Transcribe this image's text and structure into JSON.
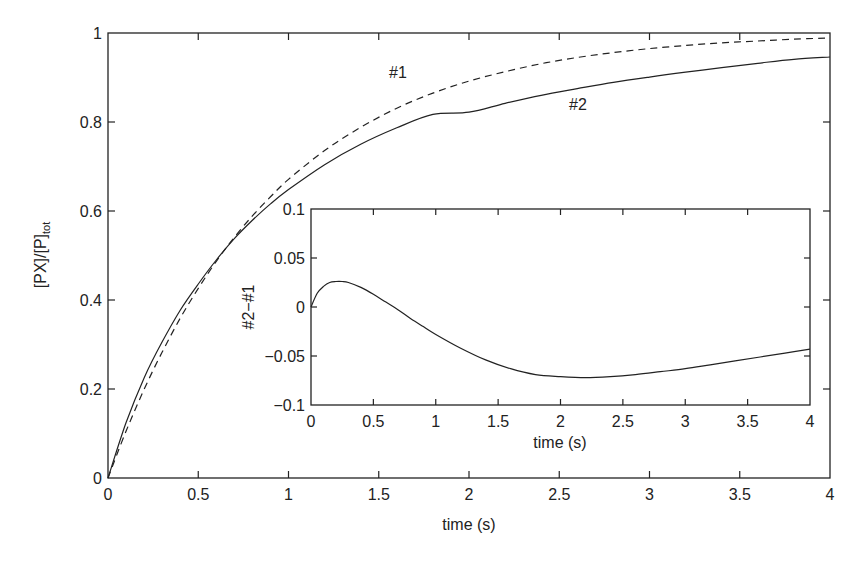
{
  "chart_data": [
    {
      "type": "line",
      "title": "",
      "xlabel": "time (s)",
      "ylabel": "[PX]/[P]tot",
      "ylabel_main": "[PX]/[P]",
      "ylabel_sub": "tot",
      "xlim": [
        0,
        4
      ],
      "ylim": [
        0,
        1
      ],
      "xticks": [
        0,
        0.5,
        1,
        1.5,
        2,
        2.5,
        3,
        3.5,
        4
      ],
      "xtick_labels": [
        "0",
        "0.5",
        "1",
        "1.5",
        "2",
        "2.5",
        "3",
        "3.5",
        "4"
      ],
      "yticks": [
        0,
        0.2,
        0.4,
        0.6,
        0.8,
        1
      ],
      "ytick_labels": [
        "0",
        "0.2",
        "0.4",
        "0.6",
        "0.8",
        "1"
      ],
      "grid": false,
      "x": [
        0,
        0.1,
        0.2,
        0.3,
        0.4,
        0.5,
        0.6,
        0.7,
        0.8,
        0.9,
        1.0,
        1.2,
        1.4,
        1.6,
        1.8,
        2.0,
        2.2,
        2.4,
        2.6,
        2.8,
        3.0,
        3.2,
        3.4,
        3.6,
        3.8,
        4.0
      ],
      "series": [
        {
          "name": "#1",
          "style": "dashed",
          "values": [
            0,
            0.105,
            0.199,
            0.283,
            0.359,
            0.426,
            0.487,
            0.541,
            0.589,
            0.632,
            0.671,
            0.736,
            0.788,
            0.831,
            0.865,
            0.892,
            0.913,
            0.931,
            0.945,
            0.956,
            0.965,
            0.972,
            0.978,
            0.982,
            0.986,
            0.989
          ]
        },
        {
          "name": "#2",
          "style": "solid",
          "values": [
            0,
            0.124,
            0.225,
            0.306,
            0.377,
            0.436,
            0.49,
            0.538,
            0.579,
            0.616,
            0.648,
            0.704,
            0.75,
            0.787,
            0.817,
            0.822,
            0.842,
            0.86,
            0.875,
            0.889,
            0.901,
            0.912,
            0.922,
            0.932,
            0.941,
            0.946
          ]
        }
      ],
      "annotations": [
        {
          "text": "#1",
          "x": 1.6,
          "y": 0.83
        },
        {
          "text": "#2",
          "x": 2.55,
          "y": 0.78
        }
      ]
    },
    {
      "type": "line",
      "title": "inset",
      "xlabel": "time (s)",
      "ylabel": "#2−#1",
      "xlim": [
        0,
        4
      ],
      "ylim": [
        -0.1,
        0.1
      ],
      "xticks": [
        0,
        0.5,
        1,
        1.5,
        2,
        2.5,
        3,
        3.5,
        4
      ],
      "xtick_labels": [
        "0",
        "0.5",
        "1",
        "1.5",
        "2",
        "2.5",
        "3",
        "3.5",
        "4"
      ],
      "yticks": [
        -0.1,
        -0.05,
        0,
        0.05,
        0.1
      ],
      "ytick_labels": [
        "−0.1",
        "−0.05",
        "0",
        "0.05",
        "0.1"
      ],
      "grid": false,
      "x": [
        0,
        0.05,
        0.1,
        0.15,
        0.2,
        0.25,
        0.3,
        0.4,
        0.5,
        0.6,
        0.7,
        0.8,
        0.9,
        1.0,
        1.2,
        1.4,
        1.6,
        1.8,
        2.0,
        2.2,
        2.4,
        2.6,
        2.8,
        3.0,
        3.2,
        3.4,
        3.6,
        3.8,
        4.0
      ],
      "series": [
        {
          "name": "#2-#1",
          "style": "solid",
          "values": [
            0,
            0.014,
            0.021,
            0.025,
            0.026,
            0.026,
            0.025,
            0.02,
            0.013,
            0.005,
            -0.003,
            -0.012,
            -0.02,
            -0.028,
            -0.042,
            -0.054,
            -0.063,
            -0.069,
            -0.071,
            -0.072,
            -0.071,
            -0.069,
            -0.066,
            -0.063,
            -0.059,
            -0.055,
            -0.051,
            -0.047,
            -0.043
          ]
        }
      ]
    }
  ]
}
